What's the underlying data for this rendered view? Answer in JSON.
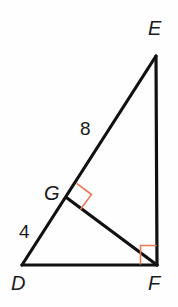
{
  "figure": {
    "kind": "right-triangle-with-altitude",
    "canvas": {
      "width": 178,
      "height": 307,
      "background": "#fefefe"
    },
    "stroke_color": "#111111",
    "stroke_width": 3.2,
    "right_angle_color": "#e8785a",
    "right_angle_width": 1.6,
    "vertices": [
      {
        "id": "D",
        "label": "D",
        "x": 22,
        "y": 265
      },
      {
        "id": "E",
        "label": "E",
        "x": 156,
        "y": 56
      },
      {
        "id": "F",
        "label": "F",
        "x": 157,
        "y": 265
      },
      {
        "id": "G",
        "label": "G",
        "x": 67,
        "y": 198
      }
    ],
    "segments": [
      {
        "id": "DE",
        "from": "D",
        "to": "E",
        "d": "M 22 265 L 156 56"
      },
      {
        "id": "EF",
        "from": "E",
        "to": "F",
        "d": "M 156 56 L 157 265"
      },
      {
        "id": "DF",
        "from": "D",
        "to": "F",
        "d": "M 22 265 L 157 265"
      },
      {
        "id": "GF",
        "from": "G",
        "to": "F",
        "d": "M 67 198 L 157 265"
      }
    ],
    "right_angles": [
      {
        "id": "angle-DGF-EGF",
        "at": "G",
        "d": "M 76.6 183.4 L 91.5 194.5 L 80.4 209.4"
      },
      {
        "id": "angle-GFE",
        "at": "F",
        "d": "M 140.5 264.5 L 140.5 245.5 L 156.5 245.5"
      }
    ],
    "measures": [
      {
        "id": "GE",
        "label": "8",
        "segment": "GE"
      },
      {
        "id": "DG",
        "label": "4",
        "segment": "DG"
      }
    ]
  }
}
